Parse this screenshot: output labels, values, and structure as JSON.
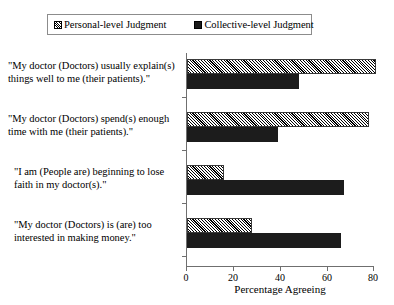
{
  "legend": {
    "entries": [
      {
        "label": "Personal-level Judgment",
        "swatch": "hatched-square-icon"
      },
      {
        "label": "Collective-level Judgment",
        "swatch": "solid-black-square-icon"
      }
    ]
  },
  "axes": {
    "x_title": "Percentage Agreeing",
    "x_ticks": [
      "0",
      "20",
      "40",
      "60",
      "80"
    ]
  },
  "chart_data": {
    "type": "bar",
    "orientation": "horizontal",
    "title": "",
    "xlabel": "Percentage Agreeing",
    "ylabel": "",
    "xlim": [
      0,
      80
    ],
    "grid": false,
    "legend_position": "top",
    "categories": [
      "\"My doctor (Doctors) usually explain(s) things well to me (their patients).\"",
      "\"My doctor (Doctors) spend(s) enough time with me (their patients).\"",
      "\"I am (People are) beginning to lose faith in my doctor(s).\"",
      "\"My doctor (Doctors) is (are) too interested in making money.\""
    ],
    "series": [
      {
        "name": "Personal-level Judgment",
        "values": [
          81,
          78,
          16,
          28
        ]
      },
      {
        "name": "Collective-level Judgment",
        "values": [
          48,
          39,
          67,
          66
        ]
      }
    ]
  }
}
